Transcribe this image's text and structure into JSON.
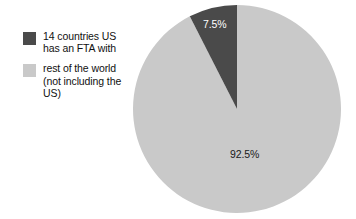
{
  "chart_data": {
    "type": "pie",
    "title": "",
    "categories": [
      "14 countries US has an FTA with",
      "rest of the world (not including the US)"
    ],
    "values": [
      7.5,
      92.5
    ],
    "value_unit": "percent",
    "data_labels": [
      "7.5%",
      "92.5%"
    ],
    "colors": [
      "#4a4a4a",
      "#c9c9c9"
    ],
    "legend_position": "left",
    "start_angle_deg": 0,
    "direction": "counterclockwise",
    "grid": false,
    "xlabel": "",
    "ylabel": ""
  },
  "legend": {
    "items": [
      {
        "label": "14 countries US\nhas an FTA with",
        "color": "#4a4a4a",
        "value_label": "7.5%"
      },
      {
        "label": "rest of the world\n(not including the\nUS)",
        "color": "#c9c9c9",
        "value_label": "92.5%"
      }
    ]
  },
  "pie": {
    "slices": [
      {
        "name": "fta-countries",
        "percent": 7.5,
        "label": "7.5%",
        "color": "#4a4a4a",
        "label_color": "#ffffff"
      },
      {
        "name": "rest-of-world",
        "percent": 92.5,
        "label": "92.5%",
        "color": "#c9c9c9",
        "label_color": "#1a1a1a"
      }
    ]
  },
  "canvas": {
    "background": "#ffffff",
    "width": 356,
    "height": 219
  }
}
